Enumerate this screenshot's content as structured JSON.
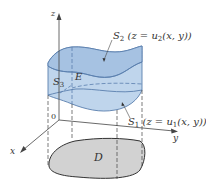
{
  "figure": {
    "type": "solid-region-diagram",
    "colors": {
      "solid_fill": "#b8d0ea",
      "solid_top_fill": "#a6c2e2",
      "solid_edge": "#5a7fae",
      "region_fill": "#d2d2d2",
      "axis_color": "#444444",
      "text_color": "#333333"
    }
  },
  "axes": {
    "z": {
      "label": "z"
    },
    "x": {
      "label": "x"
    },
    "y": {
      "label": "y"
    },
    "origin": {
      "label": "0"
    }
  },
  "labels": {
    "s2": {
      "name": "S",
      "sub": "2",
      "eq_pre": " (z = u",
      "eq_sub": "2",
      "eq_post": "(x, y))"
    },
    "s1": {
      "name": "S",
      "sub": "1",
      "eq_pre": " (z = u",
      "eq_sub": "1",
      "eq_post": "(x, y))"
    },
    "s3": {
      "name": "S",
      "sub": "3"
    },
    "e": {
      "name": "E"
    },
    "d": {
      "name": "D"
    }
  }
}
